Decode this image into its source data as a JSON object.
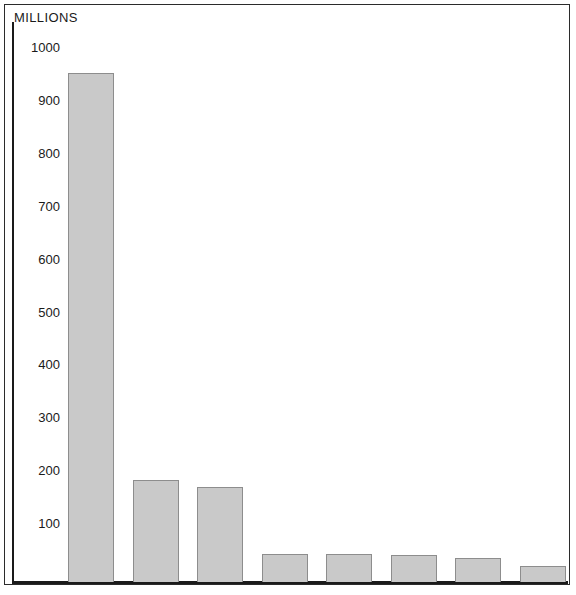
{
  "figure": {
    "axis_title": "MILLIONS",
    "bar_fill_color": "#c9c9c9",
    "bar_border_color": "#8d8d8d",
    "axis_color": "#1a1a1a",
    "background_color": "#ffffff"
  },
  "chart_data": {
    "type": "bar",
    "title": "",
    "subtitle": "",
    "xlabel": "",
    "ylabel": "MILLIONS",
    "ylim": [
      0,
      1000
    ],
    "yticks": [
      1000,
      900,
      800,
      700,
      600,
      500,
      400,
      300,
      200,
      100
    ],
    "ytick_labels": [
      "1000",
      "900",
      "800",
      "700",
      "600",
      "500",
      "400",
      "300",
      "200",
      "100"
    ],
    "grid": false,
    "legend": "none",
    "units": "millions of adherents",
    "categories": [
      "Roman Catholics",
      "Pentecostals",
      "Orthodox",
      "Anglicans and Episcopalians",
      "Baptists",
      "Lutherans",
      "Reformed and Presbyterians",
      "Methodists"
    ],
    "values": [
      962.633,
      193.679,
      179.517,
      53.82,
      53.5,
      50.797,
      45.8,
      30.415
    ],
    "bars": [
      {
        "category": "Roman Catholics",
        "value_millions": 962.633,
        "value_text": "962,633,000",
        "label": "Roman Catholics 962,633,000",
        "bold": true
      },
      {
        "category": "Pentecostals",
        "value_millions": 193.679,
        "value_text": "193,679,000",
        "label": "Pentecostals 193,679,000",
        "bold": true
      },
      {
        "category": "Orthodox",
        "value_millions": 179.517,
        "value_text": "179,517,000",
        "label": "Orthodox 179,517,000",
        "bold": true
      },
      {
        "category": "Anglicans and Episcopalians",
        "value_millions": 53.82,
        "value_text": "53,820,000",
        "label": "Anglicans and Episcopalians 53,820,000",
        "bold": true
      },
      {
        "category": "Baptists",
        "value_millions": 53.5,
        "value_text": "53,500,000",
        "label": "Baptists 53,500,000",
        "bold": true
      },
      {
        "category": "Lutherans",
        "value_millions": 50.797,
        "value_text": "50,797,000",
        "label": "Lutherans 50,797,000",
        "bold": true
      },
      {
        "category": "Reformed and Presbyterians",
        "value_millions": 45.8,
        "value_text": "45,800,000",
        "label": "Reformed and Presbyterians 45,800,000",
        "bold": true
      },
      {
        "category": "Methodists",
        "value_millions": 30.415,
        "value_text": "30,415,000",
        "label": "Methodists 30,415,000",
        "bold": true
      }
    ]
  }
}
